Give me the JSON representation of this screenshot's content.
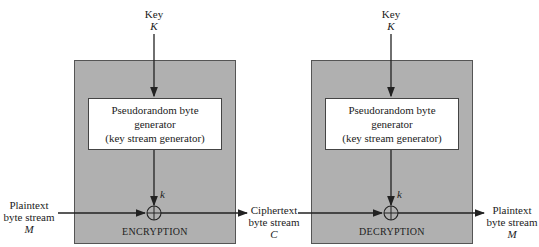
{
  "encryption": {
    "key_label": "Key",
    "key_symbol": "K",
    "generator_lines": [
      "Pseudorandom byte",
      "generator",
      "(key stream generator)"
    ],
    "keystream_symbol": "k",
    "stage_name": "ENCRYPTION",
    "input": {
      "line1": "Plaintext",
      "line2": "byte stream",
      "symbol": "M"
    }
  },
  "middle": {
    "line1": "Ciphertext",
    "line2": "byte stream",
    "symbol": "C"
  },
  "decryption": {
    "key_label": "Key",
    "key_symbol": "K",
    "generator_lines": [
      "Pseudorandom byte",
      "generator",
      "(key stream generator)"
    ],
    "keystream_symbol": "k",
    "stage_name": "DECRYPTION",
    "output": {
      "line1": "Plaintext",
      "line2": "byte stream",
      "symbol": "M"
    }
  },
  "colors": {
    "stage_fill": "#b0b0b0",
    "line": "#222222"
  }
}
